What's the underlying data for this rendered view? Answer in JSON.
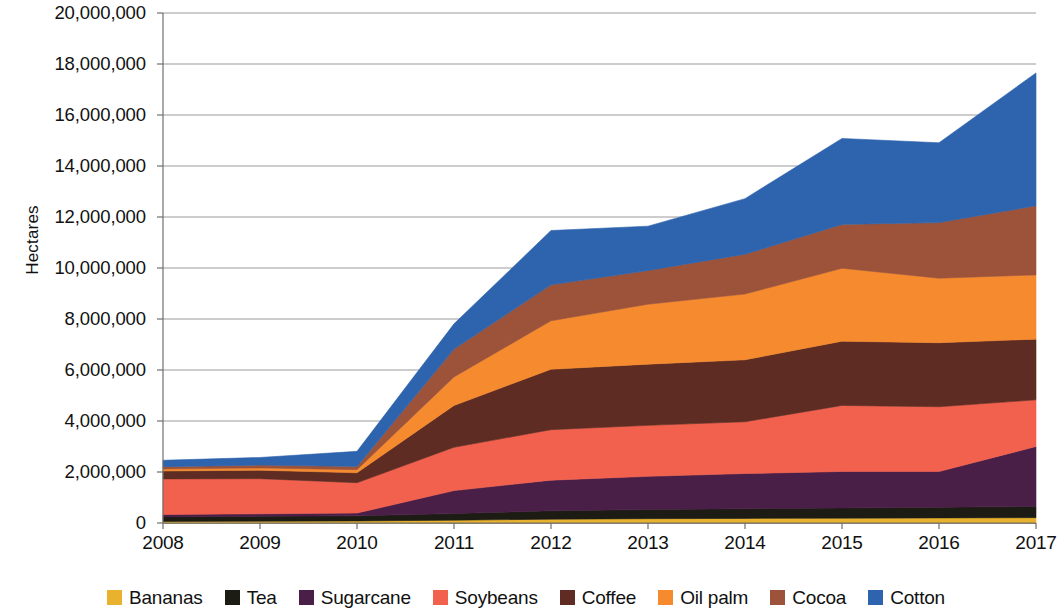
{
  "chart_data": {
    "type": "area",
    "stacked": true,
    "title": "",
    "subtitle": "",
    "xlabel": "",
    "ylabel": "Hectares",
    "categories": [
      "2008",
      "2009",
      "2010",
      "2011",
      "2012",
      "2013",
      "2014",
      "2015",
      "2016",
      "2017"
    ],
    "x": [
      2008,
      2009,
      2010,
      2011,
      2012,
      2013,
      2014,
      2015,
      2016,
      2017
    ],
    "ylim": [
      0,
      20000000
    ],
    "ytick_values": [
      0,
      2000000,
      4000000,
      6000000,
      8000000,
      10000000,
      12000000,
      14000000,
      16000000,
      18000000,
      20000000
    ],
    "ytick_labels": [
      "0",
      "2,000,000",
      "4,000,000",
      "6,000,000",
      "8,000,000",
      "10,000,000",
      "12,000,000",
      "14,000,000",
      "16,000,000",
      "18,000,000",
      "20,000,000"
    ],
    "grid": true,
    "grid_axis": "y",
    "legend_position": "bottom",
    "series": [
      {
        "name": "Bananas",
        "color": "#E8B22E",
        "values": [
          60000,
          70000,
          80000,
          110000,
          150000,
          170000,
          180000,
          190000,
          200000,
          210000
        ]
      },
      {
        "name": "Tea",
        "color": "#1C1C14",
        "values": [
          180000,
          190000,
          200000,
          260000,
          330000,
          360000,
          380000,
          400000,
          420000,
          440000
        ]
      },
      {
        "name": "Sugarcane",
        "color": "#4A1F47",
        "values": [
          90000,
          100000,
          110000,
          900000,
          1200000,
          1300000,
          1380000,
          1430000,
          1400000,
          2350000
        ]
      },
      {
        "name": "Soybeans",
        "color": "#F2604E",
        "values": [
          1400000,
          1380000,
          1190000,
          1700000,
          1980000,
          2000000,
          2030000,
          2590000,
          2540000,
          1830000
        ]
      },
      {
        "name": "Coffee",
        "color": "#5E2C22",
        "values": [
          310000,
          330000,
          390000,
          1640000,
          2370000,
          2400000,
          2430000,
          2520000,
          2510000,
          2380000
        ]
      },
      {
        "name": "Oil palm",
        "color": "#F58A2E",
        "values": [
          80000,
          90000,
          120000,
          1120000,
          1900000,
          2350000,
          2580000,
          2860000,
          2530000,
          2520000
        ]
      },
      {
        "name": "Cocoa",
        "color": "#9C5339",
        "values": [
          90000,
          110000,
          130000,
          1090000,
          1410000,
          1320000,
          1560000,
          1720000,
          2180000,
          2710000
        ]
      },
      {
        "name": "Cotton",
        "color": "#2E63AD",
        "values": [
          250000,
          300000,
          590000,
          990000,
          2130000,
          1740000,
          2180000,
          3370000,
          3130000,
          5210000
        ]
      }
    ],
    "totals": [
      2460000,
      2570000,
      2810000,
      7810000,
      11470000,
      11640000,
      12720000,
      15080000,
      14910000,
      17650000
    ]
  },
  "legend": {
    "items": [
      {
        "label": "Bananas",
        "color": "#E8B22E"
      },
      {
        "label": "Tea",
        "color": "#1C1C14"
      },
      {
        "label": "Sugarcane",
        "color": "#4A1F47"
      },
      {
        "label": "Soybeans",
        "color": "#F2604E"
      },
      {
        "label": "Coffee",
        "color": "#5E2C22"
      },
      {
        "label": "Oil palm",
        "color": "#F58A2E"
      },
      {
        "label": "Cocoa",
        "color": "#9C5339"
      },
      {
        "label": "Cotton",
        "color": "#2E63AD"
      }
    ]
  },
  "axes": {
    "y_title": "Hectares",
    "grid_color": "#9a9a9a",
    "axis_color": "#6f6f6f"
  }
}
